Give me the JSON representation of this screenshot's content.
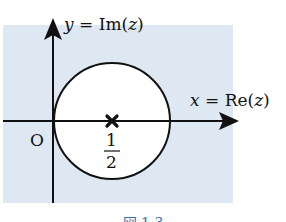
{
  "diagram": {
    "background_color": "#dde8f3",
    "y_axis_label": {
      "var": "y",
      "eq": " = Im(",
      "arg": "z",
      "close": ")"
    },
    "x_axis_label": {
      "var": "x",
      "eq": " = Re(",
      "arg": "z",
      "close": ")"
    },
    "origin_label": "O",
    "center_label_num": "1",
    "center_label_den": "2",
    "center_marker": "✖",
    "circle": {
      "center": "1/2",
      "radius": "1/2"
    }
  },
  "caption": "図 1.3"
}
